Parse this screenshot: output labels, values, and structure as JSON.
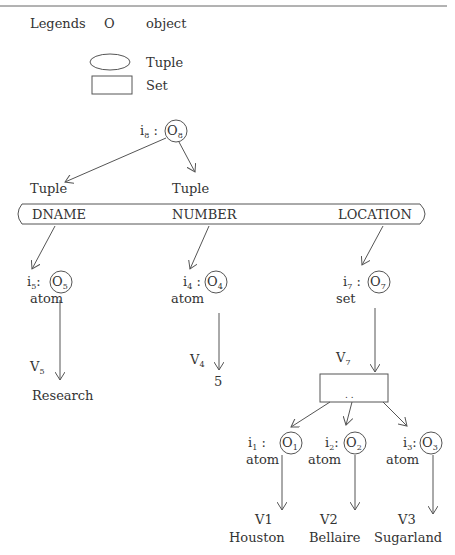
{
  "legend": {
    "title": "Legends",
    "items": [
      {
        "symbol": "O",
        "label": "object"
      },
      {
        "symbol": "ellipse",
        "label": "Tuple"
      },
      {
        "symbol": "rectangle",
        "label": "Set"
      }
    ]
  },
  "root": {
    "id": "i",
    "id_sub": "8",
    "obj": "O",
    "obj_sub": "8"
  },
  "tuple_labels": [
    "Tuple",
    "Tuple"
  ],
  "tuple_fields": [
    "DNAME",
    "NUMBER",
    "LOCATION"
  ],
  "level2": [
    {
      "id": "i",
      "id_sub": "5",
      "sep": ":",
      "obj": "O",
      "obj_sub": "5",
      "type": "atom",
      "v": "V",
      "v_sub": "5",
      "value": "Research"
    },
    {
      "id": "i",
      "id_sub": "4",
      "sep": ":",
      "obj": "O",
      "obj_sub": "4",
      "type": "atom",
      "v": "V",
      "v_sub": "4",
      "value": "5"
    },
    {
      "id": "i",
      "id_sub": "7",
      "sep": ":",
      "obj": "O",
      "obj_sub": "7",
      "type": "set",
      "v": "V",
      "v_sub": "7",
      "value": ". ."
    }
  ],
  "level3": [
    {
      "id": "i",
      "id_sub": "1",
      "obj": "O",
      "obj_sub": "1",
      "type": "atom",
      "v": "V1",
      "value": "Houston"
    },
    {
      "id": "i",
      "id_sub": "2",
      "obj": "O",
      "obj_sub": "2",
      "type": "atom",
      "v": "V2",
      "value": "Bellaire"
    },
    {
      "id": "i",
      "id_sub": "3",
      "obj": "O",
      "obj_sub": "3",
      "type": "atom",
      "v": "V3",
      "value": "Sugarland"
    }
  ]
}
